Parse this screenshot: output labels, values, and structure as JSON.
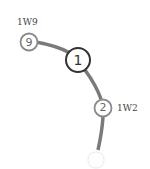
{
  "diagram": {
    "type": "transit-line-fragment",
    "line_color": "#7a7a7a",
    "nodes": [
      {
        "id": "9",
        "label": "9",
        "name": "1W9",
        "highlighted": false
      },
      {
        "id": "1",
        "label": "1",
        "name": "",
        "highlighted": true
      },
      {
        "id": "2",
        "label": "2",
        "name": "1W2",
        "highlighted": false
      },
      {
        "id": "faded",
        "label": "",
        "name": "",
        "highlighted": false
      }
    ]
  }
}
